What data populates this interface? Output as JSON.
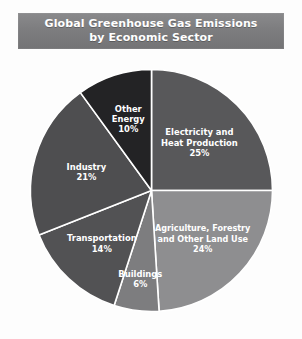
{
  "figure": {
    "background_color": "#fdfdfd",
    "title_banner_color": "#7d7d7f",
    "label_text_color": "#ffffff",
    "separator_color": "#ffffff"
  },
  "title": {
    "line1": "Global Greenhouse Gas Emissions",
    "line2": "by Economic Sector"
  },
  "chart_data": {
    "type": "pie",
    "title": "Global Greenhouse Gas Emissions by Economic Sector",
    "subtitle": "",
    "xlabel": "",
    "ylabel": "",
    "units": "percent",
    "start_angle_deg": 0,
    "direction": "clockwise",
    "legend": "none",
    "grid": false,
    "categories": [
      "Electricity and Heat Production",
      "Agriculture, Forestry and Other Land Use",
      "Buildings",
      "Transportation",
      "Industry",
      "Other Energy"
    ],
    "values": [
      25,
      24,
      6,
      14,
      21,
      10
    ],
    "colors": [
      "#58585a",
      "#8e8e90",
      "#7d7d7f",
      "#525254",
      "#4e4e50",
      "#232325"
    ],
    "slices": [
      {
        "label": "Electricity and Heat Production",
        "label_lines": [
          "Electricity and",
          "Heat Production"
        ],
        "value": 25,
        "value_text": "25%",
        "color": "#58585a"
      },
      {
        "label": "Agriculture, Forestry and Other Land Use",
        "label_lines": [
          "Agriculture, Forestry",
          "and Other Land Use"
        ],
        "value": 24,
        "value_text": "24%",
        "color": "#8e8e90"
      },
      {
        "label": "Buildings",
        "label_lines": [
          "Buildings"
        ],
        "value": 6,
        "value_text": "6%",
        "color": "#7d7d7f"
      },
      {
        "label": "Transportation",
        "label_lines": [
          "Transportation"
        ],
        "value": 14,
        "value_text": "14%",
        "color": "#525254"
      },
      {
        "label": "Industry",
        "label_lines": [
          "Industry"
        ],
        "value": 21,
        "value_text": "21%",
        "color": "#4e4e50"
      },
      {
        "label": "Other Energy",
        "label_lines": [
          "Other",
          "Energy"
        ],
        "value": 10,
        "value_text": "10%",
        "color": "#232325"
      }
    ]
  }
}
